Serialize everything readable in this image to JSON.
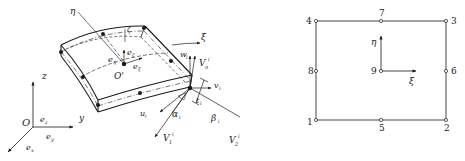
{
  "shell_element": {
    "labels": {
      "eta": "η",
      "xi": "ξ",
      "zeta": "ζ",
      "e_eta": "e",
      "e_eta_sub": "η",
      "e_zeta": "e",
      "e_zeta_sub": "ζ",
      "e_xi": "e",
      "e_xi_sub": "ξ",
      "origin_local": "O'",
      "w_i": "w",
      "w_i_sub": "i",
      "Vn": "V",
      "Vn_sub": "n",
      "Vn_sup": "i",
      "v_i": "v",
      "v_i_sub": "i",
      "t_i": "t",
      "t_i_sub": "i",
      "beta_i": "β",
      "beta_i_sub": "i",
      "alpha_i": "α",
      "alpha_i_sub": "i",
      "u_i": "u",
      "u_i_sub": "i",
      "V1": "V",
      "V1_sub": "1",
      "V1_sup": "i",
      "V2": "V",
      "V2_sub": "2",
      "V2_sup": "i"
    },
    "global_axes": {
      "origin": "O",
      "z": "z",
      "y": "y",
      "ez": "e",
      "ez_sub": "z",
      "ey": "e",
      "ey_sub": "y",
      "ex": "e",
      "ex_sub": "x"
    }
  },
  "nine_node_element": {
    "nodes": [
      {
        "id": "1",
        "x": 316,
        "y": 120
      },
      {
        "id": "2",
        "x": 446,
        "y": 120
      },
      {
        "id": "3",
        "x": 446,
        "y": 21
      },
      {
        "id": "4",
        "x": 316,
        "y": 21
      },
      {
        "id": "5",
        "x": 381,
        "y": 120
      },
      {
        "id": "6",
        "x": 446,
        "y": 71
      },
      {
        "id": "7",
        "x": 381,
        "y": 21
      },
      {
        "id": "8",
        "x": 316,
        "y": 71
      },
      {
        "id": "9",
        "x": 381,
        "y": 71
      }
    ],
    "axis_labels": {
      "eta": "η",
      "xi": "ξ"
    }
  }
}
